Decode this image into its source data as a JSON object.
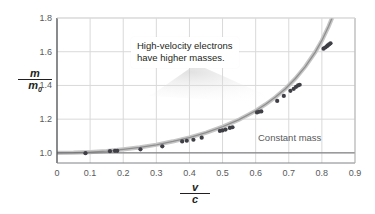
{
  "chart_data": {
    "type": "scatter",
    "title": "",
    "xlabel": "v/c",
    "ylabel": "m/m0",
    "xlim": [
      0,
      0.9
    ],
    "ylim": [
      0.94,
      1.8
    ],
    "grid": true,
    "legend": "none",
    "x_ticks": [
      "0",
      "0.1",
      "0.2",
      "0.3",
      "0.4",
      "0.5",
      "0.6",
      "0.7",
      "0.8",
      "0.9"
    ],
    "x_tick_values": [
      0,
      0.1,
      0.2,
      0.3,
      0.4,
      0.5,
      0.6,
      0.7,
      0.8,
      0.9
    ],
    "y_ticks": [
      "1.0",
      "1.2",
      "1.4",
      "1.6",
      "1.8"
    ],
    "y_tick_values": [
      1.0,
      1.2,
      1.4,
      1.6,
      1.8
    ],
    "series": [
      {
        "name": "Relativistic mass curve",
        "type": "line",
        "color": "#8a8a8a",
        "formula": "m/m0 = 1/sqrt(1-(v/c)^2)",
        "x": [
          0.0,
          0.05,
          0.1,
          0.15,
          0.2,
          0.25,
          0.3,
          0.35,
          0.4,
          0.45,
          0.5,
          0.55,
          0.6,
          0.63,
          0.66,
          0.69,
          0.72,
          0.75,
          0.78,
          0.8,
          0.82,
          0.835
        ],
        "y": [
          1.0,
          1.001,
          1.005,
          1.011,
          1.021,
          1.033,
          1.048,
          1.068,
          1.091,
          1.12,
          1.155,
          1.197,
          1.25,
          1.288,
          1.331,
          1.381,
          1.441,
          1.512,
          1.598,
          1.667,
          1.749,
          1.82
        ]
      },
      {
        "name": "Measured electron masses",
        "type": "scatter",
        "color": "#3f3f46",
        "x": [
          0.086,
          0.16,
          0.175,
          0.182,
          0.252,
          0.318,
          0.378,
          0.392,
          0.412,
          0.437,
          0.492,
          0.5,
          0.509,
          0.522,
          0.53,
          0.604,
          0.61,
          0.617,
          0.665,
          0.685,
          0.705,
          0.715,
          0.722,
          0.728,
          0.733,
          0.805,
          0.81,
          0.815,
          0.818,
          0.822,
          0.826
        ],
        "y": [
          0.998,
          1.01,
          1.012,
          1.012,
          1.021,
          1.039,
          1.068,
          1.072,
          1.078,
          1.09,
          1.13,
          1.133,
          1.138,
          1.148,
          1.152,
          1.24,
          1.244,
          1.246,
          1.308,
          1.338,
          1.368,
          1.38,
          1.392,
          1.4,
          1.404,
          1.618,
          1.625,
          1.632,
          1.638,
          1.644,
          1.65
        ]
      },
      {
        "name": "Constant mass",
        "type": "line",
        "color": "#6d6e71",
        "x": [
          0.0,
          0.9
        ],
        "y": [
          1.0,
          1.0
        ]
      }
    ],
    "annotations": [
      {
        "name": "callout",
        "text_line1": "High-velocity electrons",
        "text_line2": "have higher masses.",
        "points_to": [
          0.8,
          1.6
        ]
      },
      {
        "name": "constant-mass-label",
        "text": "Constant mass",
        "at": [
          0.7,
          1.04
        ]
      }
    ]
  },
  "axes": {
    "y_label_numerator": "m",
    "y_label_denominator": "m",
    "y_label_denominator_sub": "0",
    "x_label_numerator": "v",
    "x_label_denominator": "c"
  },
  "colors": {
    "background": "#ffffff",
    "frame": "#808285",
    "grid": "#d9d9d9",
    "curve_band": "#bfbfbf",
    "curve_line": "#8a8a8a",
    "marker": "#3f3f46",
    "text": "#231f20",
    "tick_text": "#58595b",
    "constant_line": "#6d6e71"
  }
}
